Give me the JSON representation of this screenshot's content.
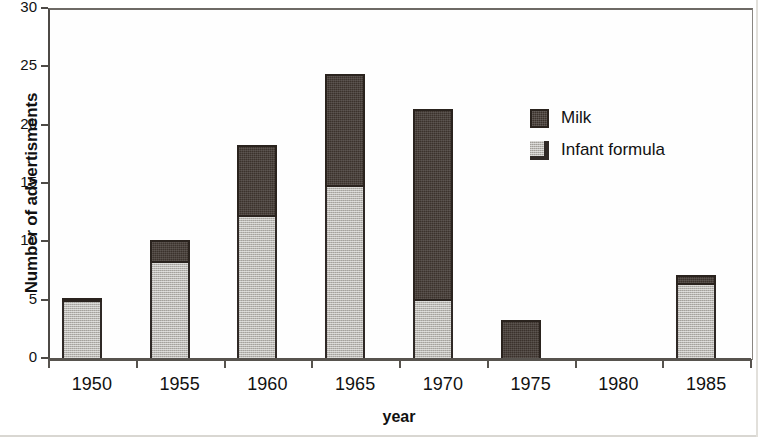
{
  "chart_data": {
    "type": "bar",
    "subtype": "stacked-vertical",
    "title": "",
    "xlabel": "year",
    "ylabel": "Number of advertisments",
    "categories": [
      "1950",
      "1955",
      "1960",
      "1965",
      "1970",
      "1975",
      "1980",
      "1985"
    ],
    "series": [
      {
        "name": "Infant formula",
        "color": "#b9b7b2",
        "values": [
          5.0,
          8.3,
          12.3,
          14.8,
          5.1,
          0.0,
          0.0,
          6.4
        ]
      },
      {
        "name": "Milk",
        "color": "#3b322c",
        "values": [
          0.3,
          2.0,
          6.1,
          9.7,
          16.4,
          3.4,
          0.0,
          0.9
        ]
      }
    ],
    "totals": [
      5.3,
      10.3,
      18.4,
      24.5,
      21.5,
      3.4,
      0.0,
      7.3
    ],
    "stack_order": [
      "Infant formula",
      "Milk"
    ],
    "ylim": [
      0,
      30
    ],
    "yticks": [
      0,
      5,
      10,
      15,
      20,
      25,
      30
    ],
    "ytick_labels": [
      "0",
      "5",
      "10",
      "15",
      "20",
      "25",
      "30"
    ],
    "grid": false,
    "legend_position": "inside-upper-right"
  },
  "axes": {
    "y_title": "Number of advertisments",
    "x_title": "year"
  },
  "legend": {
    "entries": [
      {
        "label": "Milk",
        "swatch": "milk"
      },
      {
        "label": "Infant formula",
        "swatch": "formula"
      }
    ]
  }
}
